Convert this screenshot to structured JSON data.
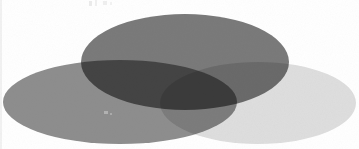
{
  "figure": {
    "background_color": "#ffffff",
    "width": 359,
    "height": 149,
    "blend_mode": "multiply",
    "render_style": "grayscale halftone scan"
  },
  "chart_data": {
    "type": "venn",
    "subtitle": "",
    "xlabel": "",
    "ylabel": "",
    "set_count": 3,
    "grid": false,
    "legend_position": "none",
    "annotations": [],
    "sets": [
      {
        "id": "set-top",
        "name": "Top set",
        "label": "",
        "fill": "#7a7a7a",
        "opacity": 1,
        "cx": 185,
        "cy": 62,
        "rx": 104,
        "ry": 48
      },
      {
        "id": "set-left",
        "name": "Left set",
        "label": "",
        "fill": "#8e8e8e",
        "opacity": 1,
        "cx": 120,
        "cy": 102,
        "rx": 117,
        "ry": 42
      },
      {
        "id": "set-right",
        "name": "Right set",
        "label": "",
        "fill": "#dedede",
        "opacity": 1,
        "cx": 258,
        "cy": 103,
        "rx": 98,
        "ry": 41
      }
    ],
    "regions": [
      {
        "id": "region-top-only",
        "name": "Top only",
        "sets": [
          "set-top"
        ],
        "fill": "#7a7a7a"
      },
      {
        "id": "region-left-only",
        "name": "Left only",
        "sets": [
          "set-left"
        ],
        "fill": "#8e8e8e"
      },
      {
        "id": "region-right-only",
        "name": "Right only",
        "sets": [
          "set-right"
        ],
        "fill": "#dedede"
      },
      {
        "id": "region-top-left",
        "name": "Top and Left",
        "sets": [
          "set-top",
          "set-left"
        ],
        "fill": "#252525"
      },
      {
        "id": "region-top-right",
        "name": "Top and Right",
        "sets": [
          "set-top",
          "set-right"
        ],
        "fill": "#6b6b6b"
      },
      {
        "id": "region-left-right",
        "name": "Left and Right",
        "sets": [
          "set-left",
          "set-right"
        ],
        "fill": "#7c7c7c"
      },
      {
        "id": "region-triple",
        "name": "Top, Left and Right",
        "sets": [
          "set-top",
          "set-left",
          "set-right"
        ],
        "fill": "#1b1b1b"
      }
    ],
    "colors": {
      "background": "#ffffff",
      "set_top": "#7a7a7a",
      "set_left": "#8e8e8e",
      "set_right": "#dedede",
      "intersection_top_left": "#252525",
      "intersection_triple": "#1b1b1b"
    }
  }
}
